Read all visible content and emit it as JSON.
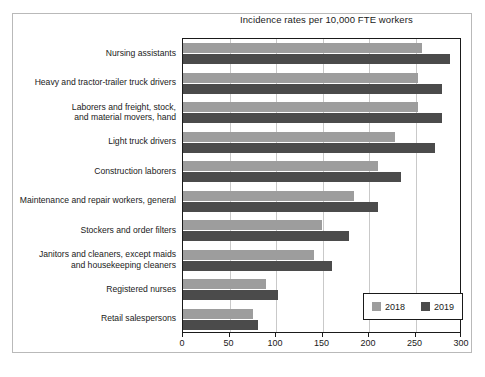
{
  "chart_data": {
    "type": "bar",
    "orientation": "horizontal",
    "title": "Incidence rates per 10,000 FTE workers",
    "xlabel": "",
    "ylabel": "",
    "xlim": [
      0,
      300
    ],
    "xticks": [
      0,
      50,
      100,
      150,
      200,
      250,
      300
    ],
    "xtick_labels": [
      "0",
      "50",
      "100",
      "150",
      "200",
      "250",
      "300"
    ],
    "grid": true,
    "legend_position": "bottom-right",
    "categories": [
      "Nursing assistants",
      "Heavy and tractor-trailer truck drivers",
      "Laborers and freight, stock,\nand material movers, hand",
      "Light truck drivers",
      "Construction laborers",
      "Maintenance and repair workers, general",
      "Stockers and order filters",
      "Janitors and cleaners, except maids\nand housekeeping cleaners",
      "Registered nurses",
      "Retail salespersons"
    ],
    "series": [
      {
        "name": "2018",
        "color": "#9d9d9d",
        "values": [
          257,
          253,
          253,
          228,
          210,
          184,
          149,
          141,
          89,
          75
        ]
      },
      {
        "name": "2019",
        "color": "#4b4b4b",
        "values": [
          287,
          278,
          279,
          271,
          234,
          210,
          179,
          160,
          102,
          81
        ]
      }
    ]
  },
  "legend": {
    "entries": [
      {
        "label": "2018",
        "color": "#9d9d9d"
      },
      {
        "label": "2019",
        "color": "#4b4b4b"
      }
    ]
  }
}
